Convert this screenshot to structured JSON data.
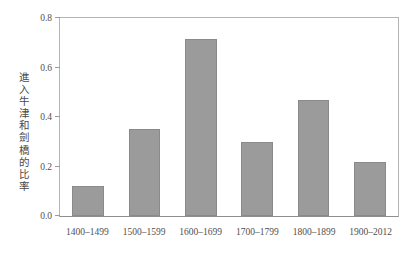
{
  "chart_data": {
    "type": "bar",
    "title": "",
    "subtitle": "",
    "xlabel": "",
    "ylabel": "進入牛津和劍橋的比率",
    "categories": [
      "1400–1499",
      "1500–1599",
      "1600–1699",
      "1700–1799",
      "1800–1899",
      "1900–2012"
    ],
    "values": [
      0.12,
      0.35,
      0.715,
      0.3,
      0.47,
      0.22
    ],
    "series": [
      {
        "name": "進入牛津和劍橋的比率",
        "values": [
          0.12,
          0.35,
          0.715,
          0.3,
          0.47,
          0.22
        ]
      }
    ],
    "ylim": [
      0.0,
      0.8
    ],
    "ytick_values": [
      0.0,
      0.2,
      0.4,
      0.6,
      0.8
    ],
    "ytick_labels": [
      "0.0",
      "0.2",
      "0.4",
      "0.6",
      "0.8"
    ],
    "grid": false,
    "legend": false,
    "legend_position": "none",
    "annotations": [],
    "colors": {
      "bar_fill": "#9b9b9b",
      "bar_edge": "#8a8a8a",
      "axis": "#b4b4b4",
      "baseline": "#8f8f8f",
      "text": "#4f4f4f",
      "background": "#ffffff"
    }
  }
}
